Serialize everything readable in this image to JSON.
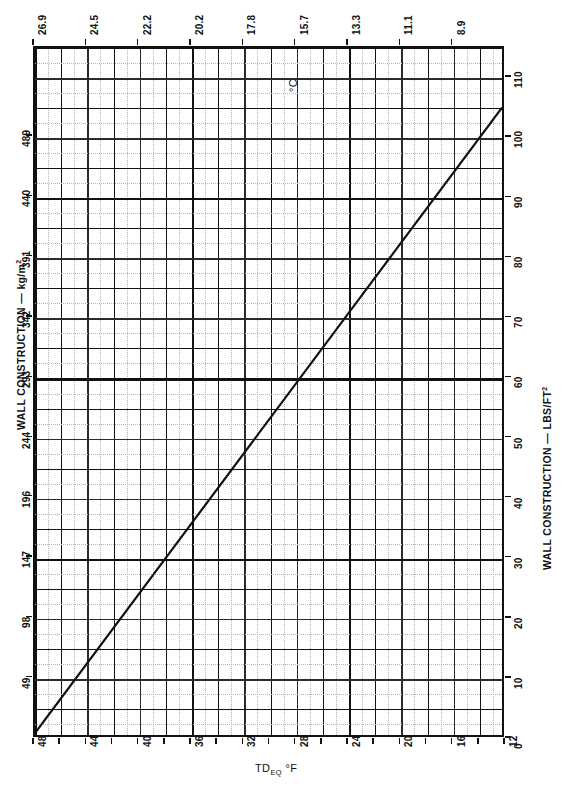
{
  "chart_data": {
    "type": "line",
    "title": "",
    "subtitle": "",
    "xlabel": "TD_EQ °F",
    "ylabel": "WALL CONSTRUCTION — kg/m²",
    "x2label": "°C",
    "y2label": "WALL CONSTRUCTION — LBS/FT²",
    "xlim": [
      48,
      12
    ],
    "ylim": [
      0,
      115
    ],
    "x2lim": [
      26.9,
      8.9
    ],
    "grid": true,
    "legend": null,
    "x_ticklabels": [
      "48",
      "44",
      "40",
      "36",
      "32",
      "28",
      "24",
      "20",
      "16",
      "12"
    ],
    "x_tickvalues": [
      48,
      44,
      40,
      36,
      32,
      28,
      24,
      20,
      16,
      12
    ],
    "x_minor_step": 2,
    "x2_ticklabels": [
      "26.9",
      "24.5",
      "22.2",
      "20.2",
      "17.8",
      "15.7",
      "13.3",
      "11.1",
      "8.9"
    ],
    "x2_tickvalues": [
      26.9,
      24.5,
      22.2,
      20.2,
      17.8,
      15.7,
      13.3,
      11.1,
      8.9
    ],
    "y_ticklabels": [
      "49",
      "98",
      "147",
      "196",
      "244",
      "293",
      "342",
      "391",
      "440",
      "489"
    ],
    "y_tickvalues": [
      49,
      98,
      147,
      196,
      244,
      293,
      342,
      391,
      440,
      489
    ],
    "y2_ticklabels": [
      "0",
      "10",
      "20",
      "30",
      "40",
      "50",
      "60",
      "70",
      "80",
      "90",
      "100",
      "110"
    ],
    "y2_tickvalues": [
      0,
      10,
      20,
      30,
      40,
      50,
      60,
      70,
      80,
      90,
      100,
      110
    ],
    "series": [
      {
        "name": "wall mass vs equivalent temperature difference",
        "style": "solid",
        "color": "#111111",
        "points": [
          {
            "x": 48,
            "y": 0
          },
          {
            "x": 12,
            "y": 105
          }
        ]
      }
    ],
    "annotations": [
      {
        "text": "°C",
        "x": 17.8,
        "y": 110,
        "rotation": -90
      }
    ]
  },
  "labels": {
    "left_axis_title": "WALL CONSTRUCTION — kg/m",
    "left_axis_superscript": "2",
    "right_axis_title": "WALL CONSTRUCTION — LBS/FT",
    "right_axis_superscript": "2",
    "bottom_axis_prefix": "TD",
    "bottom_axis_subscript": "EQ",
    "bottom_axis_suffix": "°F",
    "inner_unit": "°C"
  },
  "colors": {
    "ink": "#111111",
    "paper": "#ffffff",
    "major_grid": "#2b2b2b",
    "minor_grid": "#b5b5b5"
  }
}
